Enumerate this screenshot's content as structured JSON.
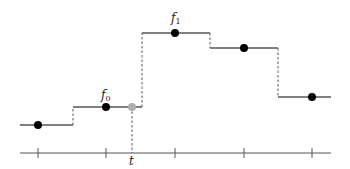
{
  "diagram": {
    "title": "",
    "colors": {
      "line": "#555555",
      "dot": "#000000",
      "query_dot": "#b0b0b0",
      "dash": "#555555"
    },
    "axis": {
      "y": 153,
      "x_start": 20,
      "x_end": 331
    },
    "ticks_x": [
      38,
      106,
      175,
      244,
      312
    ],
    "steps": [
      {
        "x1": 20,
        "x2": 73,
        "y": 125,
        "dot_x": 38
      },
      {
        "x1": 73,
        "x2": 142,
        "y": 107,
        "dot_x": 106
      },
      {
        "x1": 142,
        "x2": 210,
        "y": 33,
        "dot_x": 175
      },
      {
        "x1": 210,
        "x2": 278,
        "y": 48,
        "dot_x": 244
      },
      {
        "x1": 278,
        "x2": 331,
        "y": 97,
        "dot_x": 312
      }
    ],
    "query_point": {
      "x": 132,
      "y": 107
    },
    "labels": {
      "f0": {
        "base": "f",
        "sub": "0"
      },
      "f1": {
        "base": "f",
        "sub": "1"
      },
      "t": "t"
    }
  }
}
